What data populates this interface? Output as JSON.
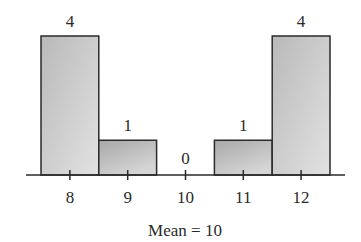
{
  "chart_data": {
    "type": "bar",
    "title": "",
    "categories": [
      "8",
      "9",
      "10",
      "11",
      "12"
    ],
    "values": [
      4,
      1,
      0,
      1,
      4
    ],
    "data_labels": [
      "4",
      "1",
      "0",
      "1",
      "4"
    ],
    "xlabel": "Mean = 10",
    "ylabel": "",
    "ylim": [
      0,
      4
    ],
    "grid": false,
    "legend": null,
    "y_axis_visible": false,
    "bar_style": "adjacent histogram bars, gray gradient fill, dark outline"
  },
  "caption": "Mean = 10",
  "colors": {
    "bar_fill_light": "#dcdcdc",
    "bar_fill_dark": "#a9a9a9",
    "outline": "#2a2a2a",
    "background": "#ffffff"
  }
}
